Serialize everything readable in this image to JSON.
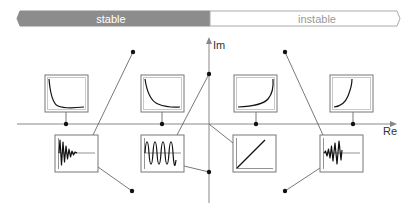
{
  "banner": {
    "stable_label": "stable",
    "instable_label": "instable",
    "stable_color": "#8c8c8c",
    "instable_color": "#ffffff"
  },
  "axes": {
    "imag_label": "Im",
    "real_label": "Re"
  },
  "plots": [
    {
      "id": "real-neg-far",
      "position": "upper-left-1",
      "response": "fast exponential decay"
    },
    {
      "id": "real-neg-near",
      "position": "upper-left-2",
      "response": "slow exponential decay"
    },
    {
      "id": "real-pos-near",
      "position": "upper-right-1",
      "response": "slow exponential growth"
    },
    {
      "id": "real-pos-far",
      "position": "upper-right-2",
      "response": "fast exponential growth"
    },
    {
      "id": "complex-neg",
      "position": "lower-left-1",
      "response": "damped oscillation"
    },
    {
      "id": "imag-axis",
      "position": "lower-left-2",
      "response": "sustained oscillation"
    },
    {
      "id": "origin",
      "position": "lower-right-1",
      "response": "linear ramp"
    },
    {
      "id": "complex-pos",
      "position": "lower-right-2",
      "response": "growing oscillation"
    }
  ]
}
